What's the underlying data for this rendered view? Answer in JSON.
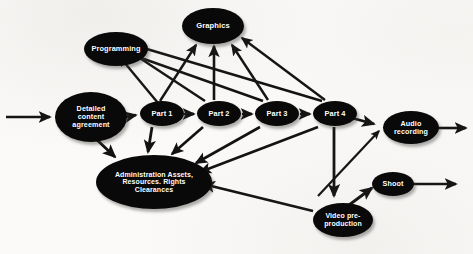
{
  "diagram": {
    "style": {
      "node_fill": "#090909",
      "node_text_color": "#ffffff",
      "edge_color": "#111111",
      "background": "#fbfaf8"
    },
    "nodes": [
      {
        "id": "detailed",
        "label": "Detailed content agreement",
        "lines": [
          "Detailed",
          "content",
          "agreement"
        ],
        "x": 55,
        "y": 92,
        "w": 72,
        "h": 50,
        "font": 7.2
      },
      {
        "id": "programming",
        "label": "Programming",
        "lines": [
          "Programming"
        ],
        "x": 84,
        "y": 32,
        "w": 64,
        "h": 34,
        "font": 7.4
      },
      {
        "id": "graphics",
        "label": "Graphics",
        "lines": [
          "Graphics"
        ],
        "x": 182,
        "y": 8,
        "w": 62,
        "h": 36,
        "font": 7.6
      },
      {
        "id": "part1",
        "label": "Part 1",
        "lines": [
          "Part 1"
        ],
        "x": 140,
        "y": 101,
        "w": 44,
        "h": 25,
        "font": 7.4
      },
      {
        "id": "part2",
        "label": "Part 2",
        "lines": [
          "Part 2"
        ],
        "x": 197,
        "y": 101,
        "w": 44,
        "h": 25,
        "font": 7.4
      },
      {
        "id": "part3",
        "label": "Part 3",
        "lines": [
          "Part 3"
        ],
        "x": 255,
        "y": 101,
        "w": 44,
        "h": 25,
        "font": 7.4
      },
      {
        "id": "part4",
        "label": "Part 4",
        "lines": [
          "Part 4"
        ],
        "x": 313,
        "y": 101,
        "w": 44,
        "h": 25,
        "font": 7.4
      },
      {
        "id": "admin",
        "label": "Administration Assets, Resources. Rights Clearances",
        "lines": [
          "Administration Assets,",
          "Resources. Rights",
          "Clearances"
        ],
        "x": 96,
        "y": 155,
        "w": 116,
        "h": 54,
        "font": 7.0
      },
      {
        "id": "audio",
        "label": "Audio recording",
        "lines": [
          "Audio",
          "recording"
        ],
        "x": 383,
        "y": 111,
        "w": 56,
        "h": 33,
        "font": 7.2
      },
      {
        "id": "video",
        "label": "Video pre-production",
        "lines": [
          "Video pre-",
          "production"
        ],
        "x": 313,
        "y": 203,
        "w": 60,
        "h": 34,
        "font": 7.0
      },
      {
        "id": "shoot",
        "label": "Shoot",
        "lines": [
          "Shoot"
        ],
        "x": 372,
        "y": 172,
        "w": 42,
        "h": 24,
        "font": 7.2
      }
    ],
    "edges": [
      {
        "from": "entry-arrow",
        "to": "detailed",
        "name": "edge-entry-to-detailed"
      },
      {
        "from": "detailed",
        "to": "part1",
        "name": "edge-detailed-to-part1"
      },
      {
        "from": "detailed",
        "to": "admin",
        "name": "edge-detailed-to-admin"
      },
      {
        "from": "part1",
        "to": "part2",
        "name": "edge-part1-to-part2"
      },
      {
        "from": "part2",
        "to": "part3",
        "name": "edge-part2-to-part3"
      },
      {
        "from": "part3",
        "to": "part4",
        "name": "edge-part3-to-part4"
      },
      {
        "from": "part1",
        "to": "programming",
        "name": "edge-part1-to-programming"
      },
      {
        "from": "part2",
        "to": "programming",
        "name": "edge-part2-to-programming"
      },
      {
        "from": "part3",
        "to": "programming",
        "name": "edge-part3-to-programming"
      },
      {
        "from": "part4",
        "to": "programming",
        "name": "edge-part4-to-programming"
      },
      {
        "from": "part1",
        "to": "graphics",
        "name": "edge-part1-to-graphics"
      },
      {
        "from": "part2",
        "to": "graphics",
        "name": "edge-part2-to-graphics"
      },
      {
        "from": "part3",
        "to": "graphics",
        "name": "edge-part3-to-graphics"
      },
      {
        "from": "part4",
        "to": "graphics",
        "name": "edge-part4-to-graphics"
      },
      {
        "from": "part1",
        "to": "admin",
        "name": "edge-part1-to-admin"
      },
      {
        "from": "part2",
        "to": "admin",
        "name": "edge-part2-to-admin"
      },
      {
        "from": "part3",
        "to": "admin",
        "name": "edge-part3-to-admin"
      },
      {
        "from": "part4",
        "to": "admin",
        "name": "edge-part4-to-admin"
      },
      {
        "from": "part4",
        "to": "audio",
        "name": "edge-part4-to-audio"
      },
      {
        "from": "part4",
        "to": "video",
        "name": "edge-part4-to-video"
      },
      {
        "from": "video",
        "to": "admin",
        "name": "edge-video-to-admin"
      },
      {
        "from": "video",
        "to": "shoot",
        "name": "edge-video-to-shoot"
      },
      {
        "from": "video",
        "to": "audio",
        "name": "edge-video-to-audio"
      },
      {
        "from": "audio",
        "to": "exit-arrow",
        "name": "edge-audio-to-exit"
      },
      {
        "from": "shoot",
        "to": "exit-arrow",
        "name": "edge-shoot-to-exit"
      }
    ]
  }
}
